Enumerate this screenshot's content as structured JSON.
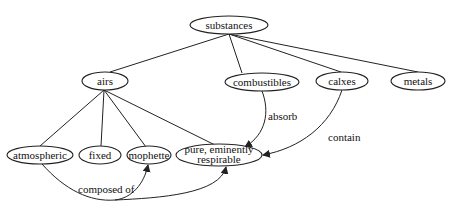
{
  "diagram": {
    "type": "concept-graph",
    "nodes": {
      "substances": {
        "label": "substances",
        "cx": 229,
        "cy": 25,
        "rx": 39,
        "ry": 9
      },
      "airs": {
        "label": "airs",
        "cx": 105,
        "cy": 81,
        "rx": 23,
        "ry": 9
      },
      "combustibles": {
        "label": "combustibles",
        "cx": 262,
        "cy": 82,
        "rx": 37,
        "ry": 9
      },
      "calxes": {
        "label": "calxes",
        "cx": 342,
        "cy": 81,
        "rx": 26,
        "ry": 9
      },
      "metals": {
        "label": "metals",
        "cx": 418,
        "cy": 81,
        "rx": 27,
        "ry": 9
      },
      "atmospheric": {
        "label": "atmospheric",
        "cx": 40,
        "cy": 155,
        "rx": 33,
        "ry": 9
      },
      "fixed": {
        "label": "fixed",
        "cx": 100,
        "cy": 155,
        "rx": 21,
        "ry": 9
      },
      "mophette": {
        "label": "mophette",
        "cx": 149,
        "cy": 155,
        "rx": 22,
        "ry": 9
      },
      "pure": {
        "label_line1": "pure, eminently",
        "label_line2": "respirable",
        "cx": 219,
        "cy": 155,
        "rx": 43,
        "ry": 11
      }
    },
    "edge_labels": {
      "absorb": "absorb",
      "contain": "contain",
      "composed_of": "composed of"
    }
  }
}
